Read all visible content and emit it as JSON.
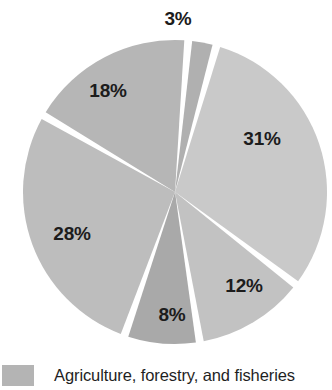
{
  "chart_data": {
    "type": "pie",
    "title": "",
    "subtitle": "",
    "xlabel": "",
    "ylabel": "",
    "grid": false,
    "legend_position": "bottom-left",
    "exploded": true,
    "gap_degrees": 3,
    "start_angle_degrees": -85,
    "categories": [
      "slice-3",
      "slice-31",
      "slice-12",
      "slice-8",
      "slice-28",
      "slice-18"
    ],
    "values": [
      3,
      31,
      12,
      8,
      28,
      18
    ],
    "labels": [
      "3%",
      "31%",
      "12%",
      "8%",
      "28%",
      "18%"
    ],
    "colors": [
      "#b0b0b0",
      "#c9c9c9",
      "#c2c2c2",
      "#a9a9a9",
      "#bdbdbd",
      "#b6b6b6"
    ],
    "slices": [
      {
        "label": "3%",
        "value": 3,
        "color": "#b0b0b0",
        "label_x": 178,
        "label_y": 18,
        "label_inside": false
      },
      {
        "label": "31%",
        "value": 31,
        "color": "#c9c9c9",
        "label_x": 262,
        "label_y": 138,
        "label_inside": true
      },
      {
        "label": "12%",
        "value": 12,
        "color": "#c2c2c2",
        "label_x": 244,
        "label_y": 285,
        "label_inside": true
      },
      {
        "label": "8%",
        "value": 8,
        "color": "#a9a9a9",
        "label_x": 172,
        "label_y": 314,
        "label_inside": true
      },
      {
        "label": "28%",
        "value": 28,
        "color": "#bdbdbd",
        "label_x": 72,
        "label_y": 233,
        "label_inside": true
      },
      {
        "label": "18%",
        "value": 18,
        "color": "#b6b6b6",
        "label_x": 108,
        "label_y": 90,
        "label_inside": true
      }
    ],
    "legend": [
      {
        "label": "Agriculture, forestry, and fisheries",
        "color": "#b4b4b4"
      }
    ]
  },
  "geometry": {
    "center_x": 175,
    "center_y": 192,
    "radius": 152
  }
}
